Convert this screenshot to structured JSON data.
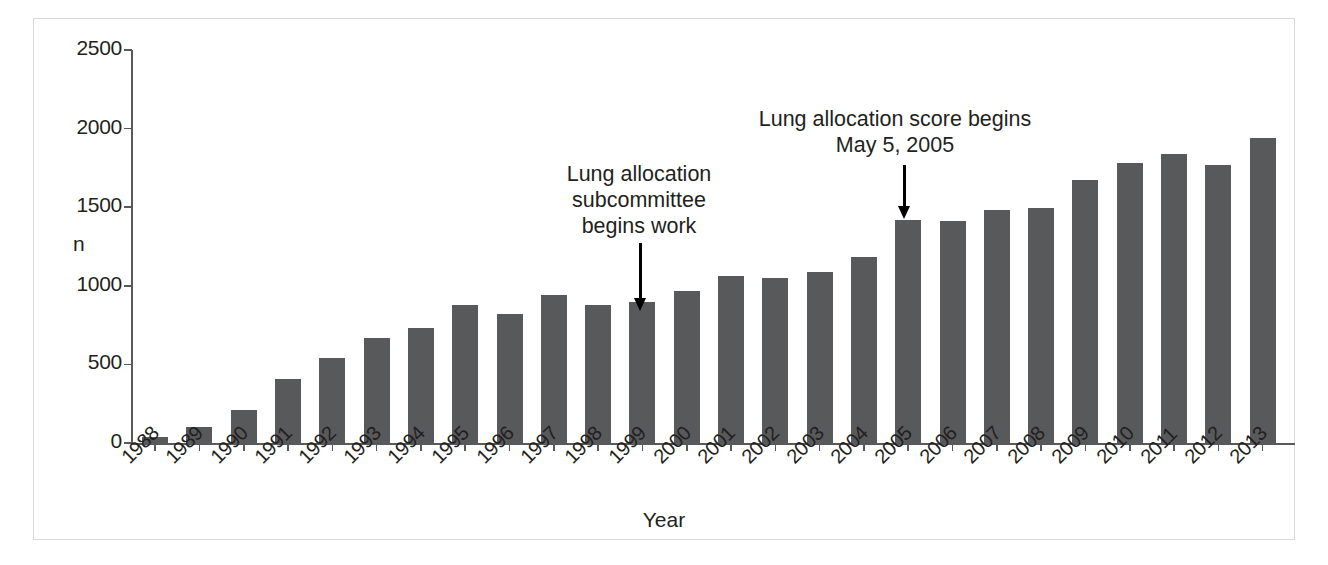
{
  "chart_data": {
    "type": "bar",
    "title": "",
    "xlabel": "Year",
    "ylabel": "n",
    "ylim": [
      0,
      2500
    ],
    "yticks": [
      0,
      500,
      1000,
      1500,
      2000,
      2500
    ],
    "ytick_labels": [
      "0",
      "500",
      "1000",
      "1500",
      "2000",
      "2500"
    ],
    "grid": false,
    "legend": null,
    "bar_color": "#58595b",
    "categories": [
      "1988",
      "1989",
      "1990",
      "1991",
      "1992",
      "1993",
      "1994",
      "1995",
      "1996",
      "1997",
      "1998",
      "1999",
      "2000",
      "2001",
      "2002",
      "2003",
      "2004",
      "2005",
      "2006",
      "2007",
      "2008",
      "2009",
      "2010",
      "2011",
      "2012",
      "2013"
    ],
    "values": [
      40,
      100,
      210,
      410,
      540,
      670,
      730,
      875,
      820,
      940,
      875,
      895,
      970,
      1065,
      1050,
      1090,
      1185,
      1420,
      1415,
      1480,
      1495,
      1670,
      1780,
      1840,
      1770,
      1940
    ],
    "annotations": [
      {
        "id": "lung-allocation-subcommittee",
        "text": "Lung allocation\nsubcommittee\nbegins work",
        "points_to_category": "1999"
      },
      {
        "id": "lung-allocation-score",
        "text": "Lung allocation score begins\nMay 5, 2005",
        "points_to_category": "2005"
      }
    ]
  }
}
